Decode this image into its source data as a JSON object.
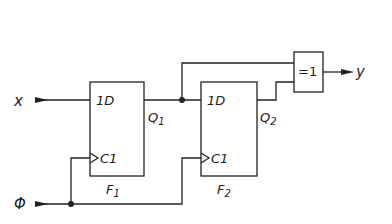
{
  "diagram": {
    "type": "logic-circuit",
    "inputs": [
      {
        "id": "x",
        "label": "x"
      },
      {
        "id": "phi",
        "label": "Φ"
      }
    ],
    "outputs": [
      {
        "id": "y",
        "label": "y"
      }
    ],
    "flipflops": [
      {
        "id": "F1",
        "name": "F",
        "sub": "1",
        "d_label": "1D",
        "c_label": "C1",
        "q_label": "Q",
        "q_sub": "1"
      },
      {
        "id": "F2",
        "name": "F",
        "sub": "2",
        "d_label": "1D",
        "c_label": "C1",
        "q_label": "Q",
        "q_sub": "2"
      }
    ],
    "gates": [
      {
        "id": "xor",
        "label": "=1"
      }
    ],
    "connections": [
      [
        "x",
        "F1.1D"
      ],
      [
        "phi",
        "F1.C1"
      ],
      [
        "phi",
        "F2.C1"
      ],
      [
        "F1.Q1",
        "F2.1D"
      ],
      [
        "F1.Q1",
        "xor"
      ],
      [
        "F2.Q2",
        "xor"
      ],
      [
        "xor",
        "y"
      ]
    ]
  }
}
